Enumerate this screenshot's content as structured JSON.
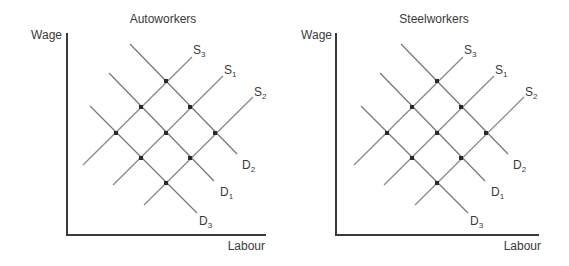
{
  "panels": [
    {
      "id": "autoworkers",
      "title": "Autoworkers",
      "y_label": "Wage",
      "x_label": "Labour",
      "curves": [
        {
          "name": "S3",
          "base": "S",
          "sub": "3",
          "type": "supply"
        },
        {
          "name": "S1",
          "base": "S",
          "sub": "1",
          "type": "supply"
        },
        {
          "name": "S2",
          "base": "S",
          "sub": "2",
          "type": "supply"
        },
        {
          "name": "D2",
          "base": "D",
          "sub": "2",
          "type": "demand"
        },
        {
          "name": "D1",
          "base": "D",
          "sub": "1",
          "type": "demand"
        },
        {
          "name": "D3",
          "base": "D",
          "sub": "3",
          "type": "demand"
        }
      ],
      "equilibrium_points": 9
    },
    {
      "id": "steelworkers",
      "title": "Steelworkers",
      "y_label": "Wage",
      "x_label": "Labour",
      "curves": [
        {
          "name": "S3",
          "base": "S",
          "sub": "3",
          "type": "supply"
        },
        {
          "name": "S1",
          "base": "S",
          "sub": "1",
          "type": "supply"
        },
        {
          "name": "S2",
          "base": "S",
          "sub": "2",
          "type": "supply"
        },
        {
          "name": "D2",
          "base": "D",
          "sub": "2",
          "type": "demand"
        },
        {
          "name": "D1",
          "base": "D",
          "sub": "1",
          "type": "demand"
        },
        {
          "name": "D3",
          "base": "D",
          "sub": "3",
          "type": "demand"
        }
      ],
      "equilibrium_points": 9
    }
  ]
}
